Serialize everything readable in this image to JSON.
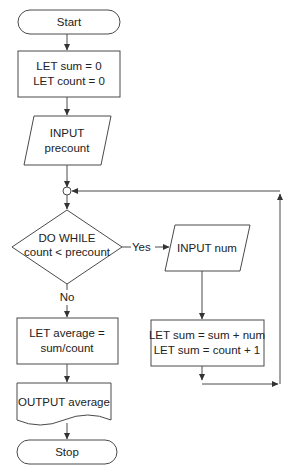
{
  "flowchart": {
    "start": {
      "label": "Start"
    },
    "init": {
      "line1": "LET sum = 0",
      "line2": "LET count = 0"
    },
    "input_precount": {
      "line1": "INPUT",
      "line2": "precount"
    },
    "decision": {
      "line1": "DO WHILE",
      "line2": "count < precount",
      "yes_label": "Yes",
      "no_label": "No"
    },
    "input_num": {
      "label": "INPUT num"
    },
    "update": {
      "line1": "LET sum = sum + num",
      "line2": "LET sum = count + 1"
    },
    "compute_average": {
      "line1": "LET average =",
      "line2": "sum/count"
    },
    "output_average": {
      "label": "OUTPUT average"
    },
    "stop": {
      "label": "Stop"
    }
  },
  "colors": {
    "stroke": "#4a4a4a",
    "text": "#222222",
    "background": "#ffffff"
  }
}
